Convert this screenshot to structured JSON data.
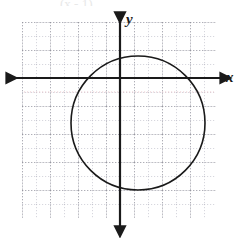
{
  "figure": {
    "kind": "coordinate-grid-with-circle",
    "background_color": "#ffffff",
    "header_fragment_text": "(x - 1)",
    "axis_labels": {
      "x": "x",
      "y": "y"
    },
    "colors": {
      "axis": "#1a1a1a",
      "grid_minor": "#b9b9c4",
      "grid_major": "#8f8f9e",
      "curve": "#1a1a1a",
      "label": "#1a1a1a"
    }
  },
  "chart_data": {
    "type": "scatter",
    "title": "",
    "xlabel": "x",
    "ylabel": "y",
    "grid": true,
    "legend": null,
    "xlim": [
      -8,
      7
    ],
    "ylim": [
      -10,
      5
    ],
    "xticks": [
      -8,
      -7,
      -6,
      -5,
      -4,
      -3,
      -2,
      -1,
      0,
      1,
      2,
      3,
      4,
      5,
      6,
      7
    ],
    "yticks": [
      -10,
      -9,
      -8,
      -7,
      -6,
      -5,
      -4,
      -3,
      -2,
      -1,
      0,
      1,
      2,
      3,
      4,
      5
    ],
    "xtick_labels": [],
    "ytick_labels": [],
    "grid_cell_px": 14,
    "origin_px": {
      "x": 120,
      "y": 78
    },
    "grid_extent_px": {
      "left": 22,
      "top": 22,
      "right": 216,
      "bottom": 218
    },
    "series": [
      {
        "name": "circle",
        "type": "circle",
        "center": [
          1.3,
          -3.2
        ],
        "radius": 4.85,
        "center_px": [
          138,
          123
        ],
        "radius_px": 67,
        "stroke": "#1a1a1a",
        "stroke_width_px": 1.6,
        "fill": "none"
      }
    ],
    "axes": [
      {
        "name": "x-axis",
        "orientation": "horizontal",
        "y_px": 78,
        "from_px": 8,
        "to_px": 222,
        "arrows": [
          "start",
          "end"
        ]
      },
      {
        "name": "y-axis",
        "orientation": "vertical",
        "x_px": 120,
        "from_px": 14,
        "to_px": 228,
        "arrows": [
          "start",
          "end"
        ]
      }
    ]
  }
}
